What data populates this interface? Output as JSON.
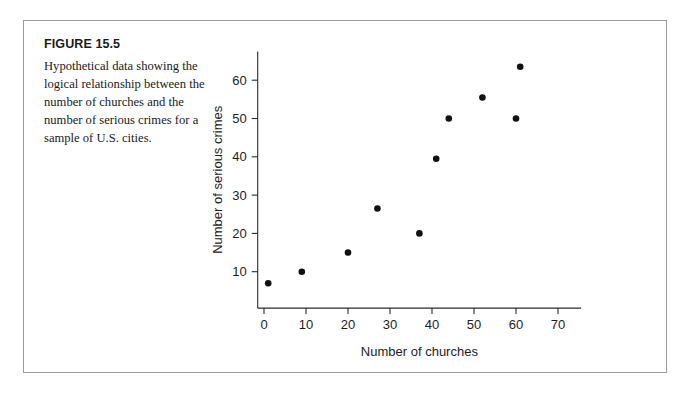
{
  "figure": {
    "number_label": "FIGURE 15.5",
    "caption": "Hypothetical data showing the logical relationship between the number of churches and the number of serious crimes for a sample of U.S. cities."
  },
  "colors": {
    "frame_border": "#9b9b9b",
    "axis": "#2b2b2b",
    "point": "#111111",
    "text": "#1a1a1a",
    "background": "#ffffff"
  },
  "chart_data": {
    "type": "scatter",
    "title": "",
    "xlabel": "Number of churches",
    "ylabel": "Number of serious crimes",
    "xlim": [
      -2,
      76
    ],
    "ylim": [
      0,
      68
    ],
    "xticks": [
      0,
      10,
      20,
      30,
      40,
      50,
      60,
      70
    ],
    "xtick_labels": [
      "0",
      "10",
      "20",
      "30",
      "40",
      "50",
      "60",
      "70"
    ],
    "yticks": [
      10,
      20,
      30,
      40,
      50,
      60
    ],
    "ytick_labels": [
      "10",
      "20",
      "30",
      "40",
      "50",
      "60"
    ],
    "grid": false,
    "legend": null,
    "series": [
      {
        "name": "U.S. cities",
        "points": [
          {
            "x": 1,
            "y": 7
          },
          {
            "x": 9,
            "y": 10
          },
          {
            "x": 20,
            "y": 15
          },
          {
            "x": 27,
            "y": 26.5
          },
          {
            "x": 37,
            "y": 20
          },
          {
            "x": 41,
            "y": 39.5
          },
          {
            "x": 44,
            "y": 50
          },
          {
            "x": 52,
            "y": 55.5
          },
          {
            "x": 60,
            "y": 50
          },
          {
            "x": 61,
            "y": 63.5
          }
        ]
      }
    ]
  }
}
